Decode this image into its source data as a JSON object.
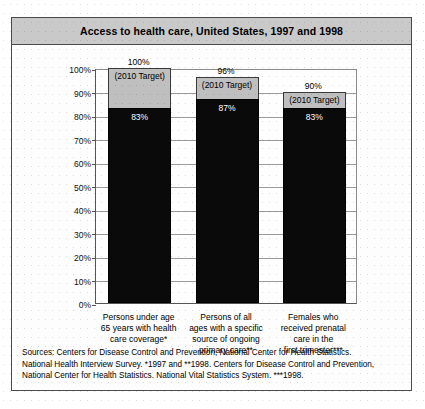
{
  "figure": {
    "title": "Access to health care, United States, 1997 and 1998"
  },
  "sources": {
    "line1": "Sources:  Centers for Disease Control and Prevention, National Center for Health Statistics.",
    "line2": "National Health Interview Survey. *1997 and **1998. Centers for Disease Control and Prevention,",
    "line3": "National Center for Health Statistics. National Vital Statistics System. ***1998."
  },
  "chart_data": {
    "type": "bar",
    "title": "Access to health care, United States, 1997 and 1998",
    "xlabel": "",
    "ylabel": "",
    "ylim": [
      0,
      100
    ],
    "grid": true,
    "legend": "none",
    "tick_labels": [
      "0%",
      "10%",
      "20%",
      "30%",
      "40%",
      "50%",
      "60%",
      "70%",
      "80%",
      "90%",
      "100%"
    ],
    "tick_values": [
      0,
      10,
      20,
      30,
      40,
      50,
      60,
      70,
      80,
      90,
      100
    ],
    "target_caption": "(2010 Target)",
    "categories": [
      "Persons under age\n65 years with health\ncare coverage*",
      "Persons of all\nages with a specific\nsource of ongoing\nprimary care**",
      "Females who\nreceived prenatal\ncare in the\nfirst trimester***"
    ],
    "series": [
      {
        "name": "Actual",
        "values": [
          83,
          87,
          83
        ],
        "labels": [
          "83%",
          "87%",
          "83%"
        ],
        "color": "#0a0a0a"
      },
      {
        "name": "2010 Target",
        "values": [
          100,
          96,
          90
        ],
        "labels": [
          "100%",
          "96%",
          "90%"
        ],
        "color": "#bfbfbf"
      }
    ],
    "bars": [
      {
        "category_lines": [
          "Persons under age",
          "65 years with health",
          "care coverage*"
        ],
        "actual": 83,
        "actual_label": "83%",
        "target": 100,
        "target_label": "100%",
        "target_caption": "(2010 Target)"
      },
      {
        "category_lines": [
          "Persons of all",
          "ages with a specific",
          "source of ongoing",
          "primary care**"
        ],
        "actual": 87,
        "actual_label": "87%",
        "target": 96,
        "target_label": "96%",
        "target_caption": "(2010 Target)"
      },
      {
        "category_lines": [
          "Females who",
          "received prenatal",
          "care in the",
          "first trimester***"
        ],
        "actual": 83,
        "actual_label": "83%",
        "target": 90,
        "target_label": "90%",
        "target_caption": "(2010 Target)"
      }
    ]
  }
}
